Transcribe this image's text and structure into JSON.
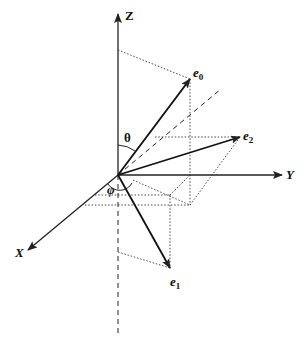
{
  "diagram": {
    "type": "3D coordinate system with unit vectors",
    "axes": {
      "z": "Z",
      "y": "Y",
      "x": "X"
    },
    "vectors": [
      {
        "name": "e",
        "sub": "0"
      },
      {
        "name": "e",
        "sub": "1"
      },
      {
        "name": "e",
        "sub": "2"
      }
    ],
    "angles": {
      "theta": "θ",
      "phi": "φ"
    },
    "colors": {
      "line": "#222222",
      "background": "#ffffff"
    }
  }
}
